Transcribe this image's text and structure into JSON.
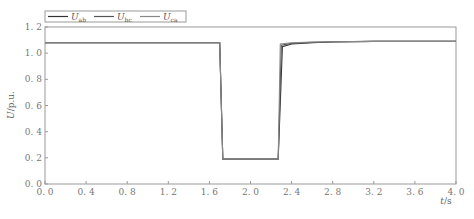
{
  "chart_data": {
    "type": "line",
    "title": "",
    "xlabel": "t/s",
    "ylabel": "U/p.u.",
    "xlim": [
      0.0,
      4.0
    ],
    "ylim": [
      0.0,
      1.2
    ],
    "xticks": [
      "0.0",
      "0.4",
      "0.8",
      "1.2",
      "1.6",
      "2.0",
      "2.4",
      "2.8",
      "3.2",
      "3.6",
      "4.0"
    ],
    "yticks": [
      "0.0",
      "0.2",
      "0.4",
      "0.6",
      "0.8",
      "1.0",
      "1.2"
    ],
    "grid": false,
    "legend_position": "top-left, above plot",
    "series": [
      {
        "name": "U_ab",
        "label_main": "U",
        "label_sub": "ab",
        "color": "#333333",
        "x": [
          0.0,
          1.7,
          1.73,
          2.27,
          2.31,
          2.4,
          2.6,
          2.8,
          3.2,
          4.0
        ],
        "y": [
          1.08,
          1.08,
          0.19,
          0.19,
          1.05,
          1.07,
          1.08,
          1.085,
          1.09,
          1.09
        ]
      },
      {
        "name": "U_bc",
        "label_main": "U",
        "label_sub": "bc",
        "color": "#555555",
        "x": [
          0.0,
          1.7,
          1.73,
          2.27,
          2.3,
          2.4,
          2.6,
          2.8,
          3.2,
          4.0
        ],
        "y": [
          1.08,
          1.08,
          0.19,
          0.19,
          1.06,
          1.075,
          1.082,
          1.087,
          1.09,
          1.09
        ]
      },
      {
        "name": "U_ca",
        "label_main": "U",
        "label_sub": "ca",
        "color": "#888888",
        "x": [
          0.0,
          1.7,
          1.73,
          2.27,
          2.29,
          2.4,
          2.6,
          2.8,
          3.2,
          4.0
        ],
        "y": [
          1.08,
          1.08,
          0.19,
          0.19,
          1.07,
          1.08,
          1.085,
          1.088,
          1.09,
          1.09
        ]
      }
    ]
  },
  "axes": {
    "xlabel_main": "t",
    "xlabel_unit": "/s",
    "ylabel_main": "U",
    "ylabel_unit": "/p.u."
  }
}
